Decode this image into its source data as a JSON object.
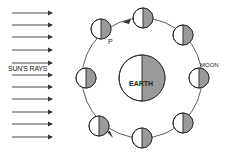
{
  "diagram": {
    "labels": {
      "sun_rays": "SUN'S RAYS",
      "moon": "MOON",
      "point": "P",
      "earth": "EARTH"
    },
    "colors": {
      "line": "#333333",
      "shade": "#9a9a9a",
      "background": "#ffffff"
    },
    "sun_ray_arrows_y": [
      13,
      25,
      37,
      50,
      63,
      75,
      87,
      99,
      112,
      124,
      137
    ],
    "earth": {
      "cx": 142,
      "cy": 78,
      "r": 23,
      "dark_side": "right"
    },
    "orbit": {
      "cx": 142,
      "cy": 78,
      "r": 60,
      "direction": "counterclockwise"
    },
    "moons": [
      {
        "id": "moon-top-left-p",
        "cx": 101,
        "cy": 29,
        "dark_side": "right"
      },
      {
        "id": "moon-top",
        "cx": 143,
        "cy": 18,
        "dark_side": "right"
      },
      {
        "id": "moon-upper-right",
        "cx": 183,
        "cy": 35,
        "dark_side": "right"
      },
      {
        "id": "moon-right",
        "cx": 199,
        "cy": 78,
        "dark_side": "right"
      },
      {
        "id": "moon-lower-right",
        "cx": 183,
        "cy": 123,
        "dark_side": "right"
      },
      {
        "id": "moon-bottom",
        "cx": 142,
        "cy": 138,
        "dark_side": "right"
      },
      {
        "id": "moon-lower-left",
        "cx": 99,
        "cy": 126,
        "dark_side": "right"
      },
      {
        "id": "moon-left",
        "cx": 86,
        "cy": 78,
        "dark_side": "right"
      }
    ]
  }
}
